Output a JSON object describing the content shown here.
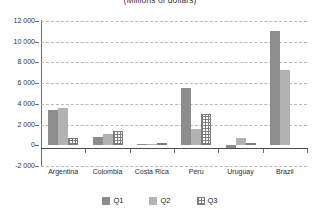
{
  "chart_data": {
    "type": "bar",
    "title": "(Millions of dollars)",
    "xlabel": "",
    "ylabel": "",
    "ylim": [
      -2000,
      12000
    ],
    "ytick_step": 2000,
    "grid": true,
    "legend_position": "bottom",
    "categories": [
      "Argentina",
      "Colombia",
      "Costa Rica",
      "Peru",
      "Uruguay",
      "Brazil"
    ],
    "ytick_labels": [
      "12 000",
      "10 000",
      "8 000",
      "6 000",
      "4 000",
      "2 000",
      "0",
      "-2 000"
    ],
    "ytick_values": [
      12000,
      10000,
      8000,
      6000,
      4000,
      2000,
      0,
      -2000
    ],
    "series": [
      {
        "name": "Q1",
        "color": "#8d8d8d",
        "values": [
          3400,
          800,
          100,
          5500,
          -250,
          11000
        ]
      },
      {
        "name": "Q2",
        "color": "#b2b2b2",
        "values": [
          3650,
          1100,
          120,
          1600,
          700,
          7300
        ]
      },
      {
        "name": "Q3",
        "color": "#7d7d7d",
        "pattern": "grid-hatch",
        "values": [
          700,
          1400,
          200,
          3000,
          150,
          0
        ]
      }
    ]
  },
  "legend": {
    "items": [
      {
        "label": "Q1",
        "swatch": "q1"
      },
      {
        "label": "Q2",
        "swatch": "q2"
      },
      {
        "label": "Q3",
        "swatch": "q3"
      }
    ]
  }
}
